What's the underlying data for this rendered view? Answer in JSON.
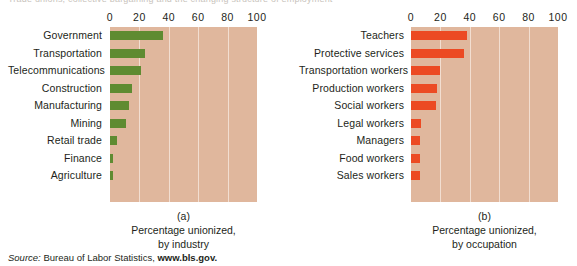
{
  "top_cut_text": "Trade unions, collective bargaining and the changing structure of employment",
  "source": {
    "label": "Source:",
    "text": "Bureau of Labor Statistics,",
    "url": "www.bls.gov."
  },
  "panels": [
    {
      "letter": "(a)",
      "caption_line1": "Percentage unionized,",
      "caption_line2": "by industry"
    },
    {
      "letter": "(b)",
      "caption_line1": "Percentage unionized,",
      "caption_line2": "by occupation"
    }
  ],
  "chart_data": [
    {
      "type": "bar",
      "orientation": "horizontal",
      "title": "(a)",
      "subtitle": "Percentage unionized, by industry",
      "xlabel": "",
      "ylabel": "",
      "xlim": [
        0,
        100
      ],
      "ticks": [
        0,
        20,
        40,
        60,
        80,
        100
      ],
      "grid": true,
      "legend": "none",
      "bar_color": "#5f8b31",
      "plot_background": "#e0b79d",
      "categories": [
        "Government",
        "Transportation",
        "Telecommunications",
        "Construction",
        "Manufacturing",
        "Mining",
        "Retail trade",
        "Finance",
        "Agriculture"
      ],
      "values": [
        36,
        24,
        21,
        15,
        13,
        11,
        5,
        2,
        2
      ]
    },
    {
      "type": "bar",
      "orientation": "horizontal",
      "title": "(b)",
      "subtitle": "Percentage unionized, by occupation",
      "xlabel": "",
      "ylabel": "",
      "xlim": [
        0,
        100
      ],
      "ticks": [
        0,
        20,
        40,
        60,
        80,
        100
      ],
      "grid": true,
      "legend": "none",
      "bar_color": "#ec4a23",
      "plot_background": "#e0b79d",
      "categories": [
        "Teachers",
        "Protective services",
        "Transportation workers",
        "Production workers",
        "Social workers",
        "Legal workers",
        "Managers",
        "Food workers",
        "Sales workers"
      ],
      "values": [
        38,
        36,
        20,
        18,
        17,
        7,
        6,
        6,
        6
      ]
    }
  ]
}
